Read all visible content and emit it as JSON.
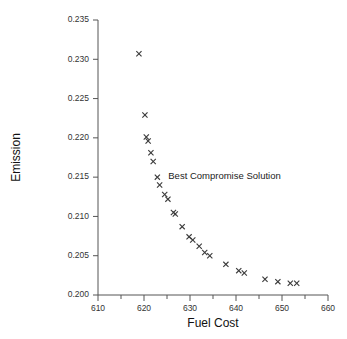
{
  "chart_data": {
    "type": "scatter",
    "title": "",
    "xlabel": "Fuel Cost",
    "ylabel": "Emission",
    "xlim": [
      610,
      660
    ],
    "ylim": [
      0.2,
      0.235
    ],
    "xticks": [
      610,
      620,
      630,
      640,
      650,
      660
    ],
    "xtick_labels": [
      "610",
      "620",
      "630",
      "640",
      "650",
      "660"
    ],
    "xminor_ticks": [
      615,
      625,
      635,
      645,
      655
    ],
    "yticks": [
      0.2,
      0.205,
      0.21,
      0.215,
      0.22,
      0.225,
      0.23,
      0.235
    ],
    "ytick_labels": [
      "0.200",
      "0.205",
      "0.210",
      "0.215",
      "0.220",
      "0.225",
      "0.230",
      "0.235"
    ],
    "grid": false,
    "legend": null,
    "marker": "x",
    "series": [
      {
        "name": "Pareto front",
        "points": [
          [
            618.9,
            0.2307
          ],
          [
            620.2,
            0.2229
          ],
          [
            620.5,
            0.2201
          ],
          [
            620.9,
            0.2196
          ],
          [
            621.5,
            0.2181
          ],
          [
            622.0,
            0.217
          ],
          [
            622.9,
            0.215
          ],
          [
            623.4,
            0.214
          ],
          [
            624.5,
            0.2128
          ],
          [
            625.2,
            0.2122
          ],
          [
            626.4,
            0.2105
          ],
          [
            626.8,
            0.2103
          ],
          [
            628.3,
            0.2087
          ],
          [
            629.8,
            0.2074
          ],
          [
            630.6,
            0.207
          ],
          [
            632.0,
            0.2062
          ],
          [
            633.2,
            0.2054
          ],
          [
            634.3,
            0.205
          ],
          [
            637.8,
            0.2039
          ],
          [
            640.6,
            0.2031
          ],
          [
            641.8,
            0.2028
          ],
          [
            646.3,
            0.202
          ],
          [
            649.1,
            0.2017
          ],
          [
            651.8,
            0.2015
          ],
          [
            653.2,
            0.2015
          ]
        ]
      }
    ],
    "annotations": [
      {
        "text": "Best Compromise Solution",
        "x": 637.5,
        "y": 0.2148
      }
    ]
  }
}
